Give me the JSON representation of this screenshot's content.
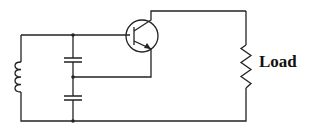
{
  "diagram": {
    "type": "circuit",
    "components": [
      {
        "id": "Q1",
        "kind": "NPN transistor"
      },
      {
        "id": "L1",
        "kind": "inductor"
      },
      {
        "id": "C1",
        "kind": "capacitor"
      },
      {
        "id": "C2",
        "kind": "capacitor"
      },
      {
        "id": "RL",
        "kind": "resistor",
        "label": "Load"
      }
    ],
    "labels": {
      "load": "Load"
    },
    "colors": {
      "wire": "#222222",
      "background": "#ffffff"
    }
  }
}
